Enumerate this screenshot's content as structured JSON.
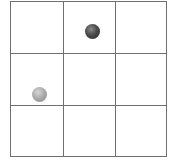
{
  "board": {
    "rows": 3,
    "cols": 3,
    "line_color": "#6e6e6e",
    "background": "#ffffff"
  },
  "pieces": [
    {
      "name": "dark-ball",
      "row": 0,
      "col": 1,
      "color": "#3a3a3a"
    },
    {
      "name": "light-ball",
      "row": 1,
      "col": 0,
      "color": "#a8a8a8"
    }
  ]
}
